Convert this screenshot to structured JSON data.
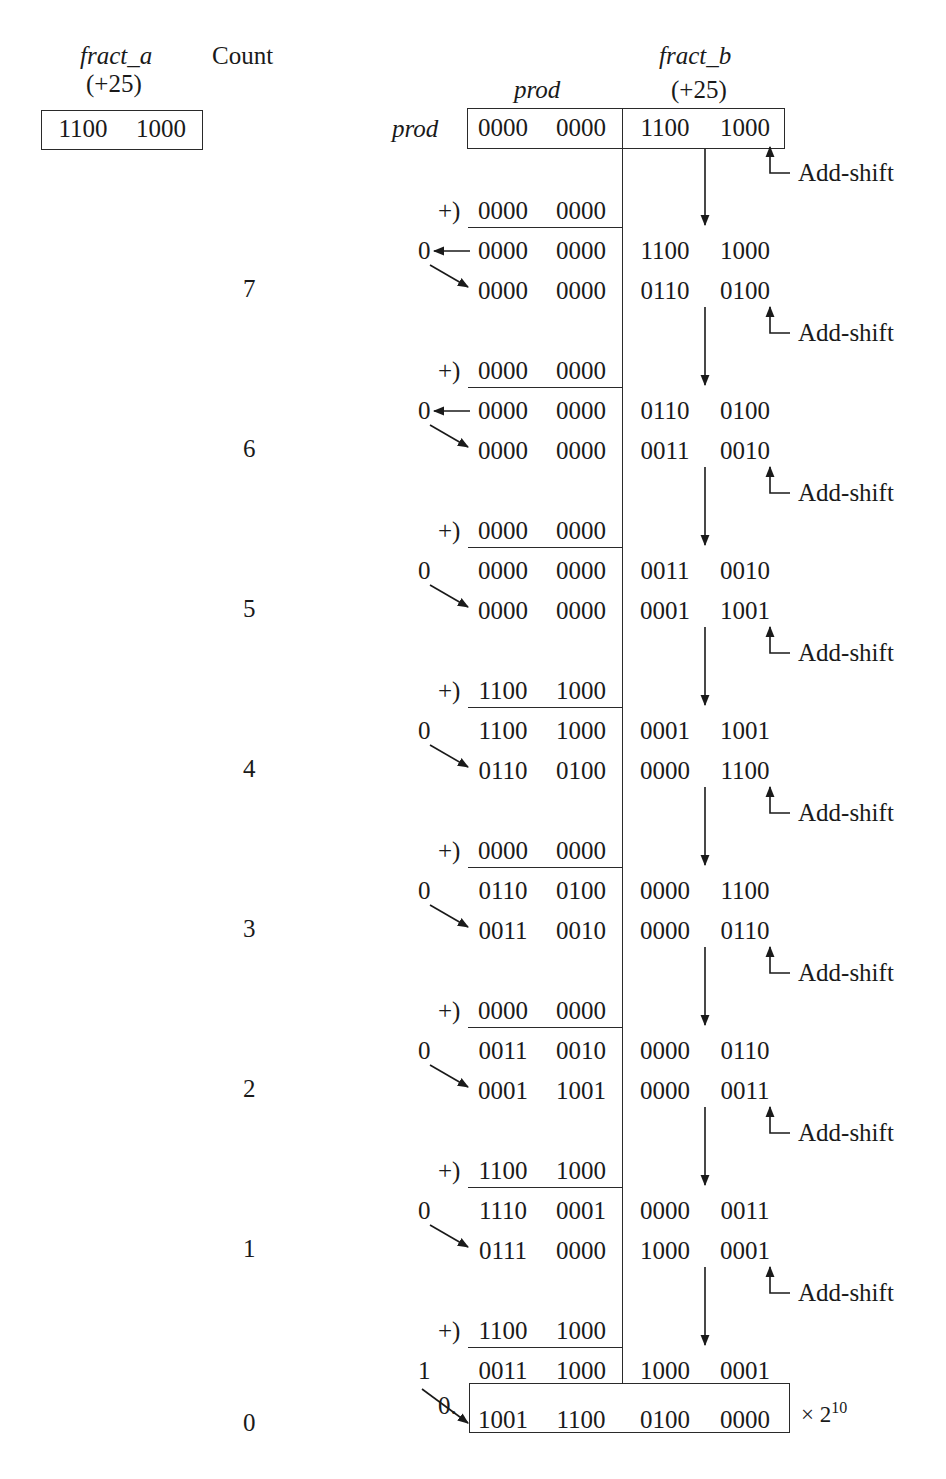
{
  "labels": {
    "fract_a": "fract_a",
    "fract_a_value": "(+25)",
    "count": "Count",
    "fract_b": "fract_b",
    "fract_b_value": "(+25)",
    "prod_top": "prod",
    "prod_left": "prod",
    "add_shift": "Add-shift",
    "plus": "+)",
    "final_prefix": "0.",
    "final_multiplier": "× 2",
    "final_exponent": "10"
  },
  "fract_a_register": [
    "1100",
    "1000"
  ],
  "initial_prod": [
    "0000",
    "0000",
    "1100",
    "1000"
  ],
  "steps": [
    {
      "count": "7",
      "addend": [
        "0000",
        "0000"
      ],
      "carry": "0",
      "carry_arrow_left": true,
      "sum": [
        "0000",
        "0000",
        "1100",
        "1000"
      ],
      "shifted": [
        "0000",
        "0000",
        "0110",
        "0100"
      ]
    },
    {
      "count": "6",
      "addend": [
        "0000",
        "0000"
      ],
      "carry": "0",
      "carry_arrow_left": true,
      "sum": [
        "0000",
        "0000",
        "0110",
        "0100"
      ],
      "shifted": [
        "0000",
        "0000",
        "0011",
        "0010"
      ]
    },
    {
      "count": "5",
      "addend": [
        "0000",
        "0000"
      ],
      "carry": "0",
      "carry_arrow_left": false,
      "sum": [
        "0000",
        "0000",
        "0011",
        "0010"
      ],
      "shifted": [
        "0000",
        "0000",
        "0001",
        "1001"
      ]
    },
    {
      "count": "4",
      "addend": [
        "1100",
        "1000"
      ],
      "carry": "0",
      "carry_arrow_left": false,
      "sum": [
        "1100",
        "1000",
        "0001",
        "1001"
      ],
      "shifted": [
        "0110",
        "0100",
        "0000",
        "1100"
      ]
    },
    {
      "count": "3",
      "addend": [
        "0000",
        "0000"
      ],
      "carry": "0",
      "carry_arrow_left": false,
      "sum": [
        "0110",
        "0100",
        "0000",
        "1100"
      ],
      "shifted": [
        "0011",
        "0010",
        "0000",
        "0110"
      ]
    },
    {
      "count": "2",
      "addend": [
        "0000",
        "0000"
      ],
      "carry": "0",
      "carry_arrow_left": false,
      "sum": [
        "0011",
        "0010",
        "0000",
        "0110"
      ],
      "shifted": [
        "0001",
        "1001",
        "0000",
        "0011"
      ]
    },
    {
      "count": "1",
      "addend": [
        "1100",
        "1000"
      ],
      "carry": "0",
      "carry_arrow_left": false,
      "sum": [
        "1110",
        "0001",
        "0000",
        "0011"
      ],
      "shifted": [
        "0111",
        "0000",
        "1000",
        "0001"
      ]
    },
    {
      "count": "0",
      "addend": [
        "1100",
        "1000"
      ],
      "carry": "1",
      "carry_arrow_left": false,
      "sum": [
        "0011",
        "1000",
        "1000",
        "0001"
      ],
      "shifted": [
        "1001",
        "1100",
        "0100",
        "0000"
      ],
      "final": true
    }
  ]
}
